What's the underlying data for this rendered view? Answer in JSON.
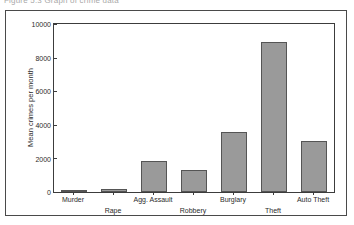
{
  "caption": {
    "text": "Figure 5.3   Graph of crime data"
  },
  "colors": {
    "bar_fill": "#9a9a9a",
    "bar_stroke": "#555555",
    "axis": "#3c3c3c",
    "frame": "#4a4a4a",
    "text": "#2b2b2b",
    "background": "#ffffff"
  },
  "chart_data": {
    "type": "bar",
    "title": "",
    "xlabel": "",
    "ylabel": "Mean crimes per month",
    "categories": [
      "Murder",
      "Rape",
      "Agg. Assault",
      "Robbery",
      "Burglary",
      "Theft",
      "Auto Theft"
    ],
    "values": [
      25,
      150,
      1850,
      1300,
      3600,
      8900,
      3050
    ],
    "ylim": [
      0,
      10000
    ],
    "yticks": [
      0,
      2000,
      4000,
      6000,
      8000,
      10000
    ],
    "ytick_labels": [
      "0",
      "2000",
      "4000",
      "6000",
      "8000",
      "10000"
    ],
    "grid": false,
    "legend": null,
    "label_rows": [
      "top",
      "bottom",
      "top",
      "bottom",
      "top",
      "bottom",
      "top"
    ]
  }
}
